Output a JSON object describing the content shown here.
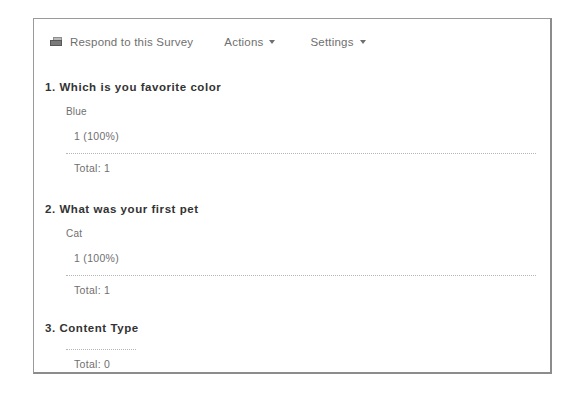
{
  "toolbar": {
    "respond_label": "Respond to this Survey",
    "respond_icon": "survey-icon",
    "actions_label": "Actions",
    "settings_label": "Settings",
    "caret_icon": "caret-down-icon"
  },
  "theme": {
    "bar_color": "#5c5c5c",
    "panel_border": "#9a9a9a",
    "text_color": "#6f6f6f",
    "heading_color": "#333333"
  },
  "questions": [
    {
      "title": "1. Which is you favorite color",
      "options": [
        {
          "label": "Blue",
          "count_label": "1 (100%)",
          "count": 1,
          "percent": 100
        }
      ],
      "total_label": "Total: 1",
      "total": 1,
      "separator": "full"
    },
    {
      "title": "2. What was your first pet",
      "options": [
        {
          "label": "Cat",
          "count_label": "1 (100%)",
          "count": 1,
          "percent": 100
        }
      ],
      "total_label": "Total: 1",
      "total": 1,
      "separator": "full"
    },
    {
      "title": "3. Content Type",
      "options": [],
      "total_label": "Total: 0",
      "total": 0,
      "separator": "short"
    }
  ]
}
